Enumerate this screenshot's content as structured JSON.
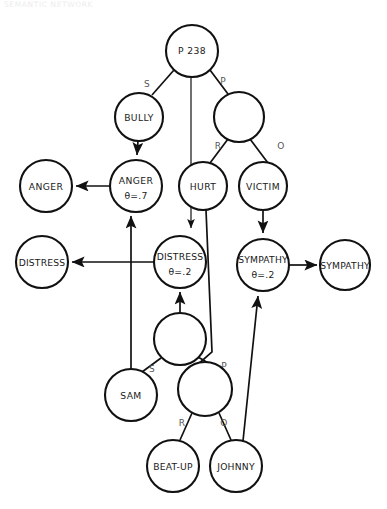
{
  "header": {
    "caption": "SEMANTIC NETWORK"
  },
  "diagram": {
    "type": "semantic-network",
    "background": "#ffffff",
    "stroke": "#111111",
    "nodes": [
      {
        "id": "root",
        "label": "P 238",
        "sub": "",
        "cx": 192,
        "cy": 51,
        "r": 26
      },
      {
        "id": "bully",
        "label": "BULLY",
        "sub": "",
        "cx": 139,
        "cy": 117,
        "r": 24
      },
      {
        "id": "prop1",
        "label": "",
        "sub": "",
        "cx": 239,
        "cy": 117,
        "r": 25
      },
      {
        "id": "anger_left",
        "label": "ANGER",
        "sub": "",
        "cx": 46,
        "cy": 186,
        "r": 26
      },
      {
        "id": "anger_theta",
        "label": "ANGER",
        "sub": "θ=.7",
        "cx": 136,
        "cy": 186,
        "r": 26
      },
      {
        "id": "hurt",
        "label": "HURT",
        "sub": "",
        "cx": 203,
        "cy": 186,
        "r": 24
      },
      {
        "id": "victim",
        "label": "VICTIM",
        "sub": "",
        "cx": 263,
        "cy": 186,
        "r": 24
      },
      {
        "id": "distress_left",
        "label": "DISTRESS",
        "sub": "",
        "cx": 42,
        "cy": 262,
        "r": 26
      },
      {
        "id": "distress_theta",
        "label": "DISTRESS",
        "sub": "θ=.2",
        "cx": 180,
        "cy": 262,
        "r": 26
      },
      {
        "id": "sympathy_theta",
        "label": "SYMPATHY",
        "sub": "θ=.2",
        "cx": 263,
        "cy": 265,
        "r": 26
      },
      {
        "id": "sympathy_right",
        "label": "SYMPATHY",
        "sub": "",
        "cx": 345,
        "cy": 265,
        "r": 25
      },
      {
        "id": "prop2",
        "label": "",
        "sub": "",
        "cx": 180,
        "cy": 339,
        "r": 26
      },
      {
        "id": "sam",
        "label": "SAM",
        "sub": "",
        "cx": 131,
        "cy": 395,
        "r": 26
      },
      {
        "id": "prop3",
        "label": "",
        "sub": "",
        "cx": 205,
        "cy": 389,
        "r": 27
      },
      {
        "id": "beatup",
        "label": "BEAT-UP",
        "sub": "",
        "cx": 173,
        "cy": 466,
        "r": 26
      },
      {
        "id": "johnny",
        "label": "JOHNNY",
        "sub": "",
        "cx": 236,
        "cy": 466,
        "r": 26
      }
    ],
    "edge_labels": [
      {
        "id": "root-s",
        "text": "S",
        "x": 147,
        "y": 84
      },
      {
        "id": "root-p",
        "text": "P",
        "x": 223,
        "y": 81
      },
      {
        "id": "prop1-r",
        "text": "R",
        "x": 218,
        "y": 146
      },
      {
        "id": "prop1-o",
        "text": "O",
        "x": 281,
        "y": 146
      },
      {
        "id": "prop2-s",
        "text": "S",
        "x": 152,
        "y": 369
      },
      {
        "id": "prop2-p",
        "text": "P",
        "x": 224,
        "y": 366
      },
      {
        "id": "prop3-r",
        "text": "R",
        "x": 182,
        "y": 423
      },
      {
        "id": "prop3-o",
        "text": "O",
        "x": 224,
        "y": 423
      }
    ],
    "relations": [
      {
        "from": "root",
        "to": "bully",
        "label": "S",
        "kind": "plain"
      },
      {
        "from": "root",
        "to": "prop1",
        "label": "P",
        "kind": "plain"
      },
      {
        "from": "root",
        "to": "distress_theta",
        "label": "",
        "kind": "arrow"
      },
      {
        "from": "bully",
        "to": "anger_theta",
        "label": "",
        "kind": "arrow"
      },
      {
        "from": "prop1",
        "to": "hurt",
        "label": "R",
        "kind": "plain"
      },
      {
        "from": "prop1",
        "to": "victim",
        "label": "O",
        "kind": "plain"
      },
      {
        "from": "anger_theta",
        "to": "anger_left",
        "label": "",
        "kind": "arrow"
      },
      {
        "from": "distress_theta",
        "to": "distress_left",
        "label": "",
        "kind": "arrow"
      },
      {
        "from": "victim",
        "to": "sympathy_theta",
        "label": "",
        "kind": "arrow"
      },
      {
        "from": "sympathy_theta",
        "to": "sympathy_right",
        "label": "",
        "kind": "arrow"
      },
      {
        "from": "prop2",
        "to": "distress_theta",
        "label": "",
        "kind": "arrow"
      },
      {
        "from": "prop2",
        "to": "sam",
        "label": "S",
        "kind": "plain"
      },
      {
        "from": "prop2",
        "to": "prop3",
        "label": "P",
        "kind": "plain"
      },
      {
        "from": "prop3",
        "to": "beatup",
        "label": "R",
        "kind": "plain"
      },
      {
        "from": "prop3",
        "to": "johnny",
        "label": "O",
        "kind": "plain"
      },
      {
        "from": "sam",
        "to": "anger_theta",
        "label": "",
        "kind": "arrow"
      },
      {
        "from": "hurt",
        "to": "prop3",
        "label": "",
        "kind": "plain"
      },
      {
        "from": "johnny",
        "to": "sympathy_theta",
        "label": "",
        "kind": "arrow"
      }
    ]
  }
}
